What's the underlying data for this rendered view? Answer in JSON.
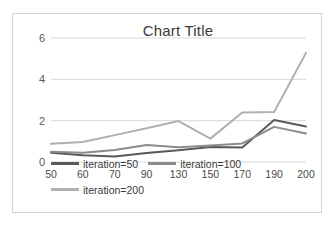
{
  "chart_data": {
    "type": "line",
    "title": "Chart Title",
    "xlabel": "",
    "ylabel": "",
    "categories": [
      "50",
      "60",
      "70",
      "90",
      "130",
      "150",
      "170",
      "190",
      "200"
    ],
    "ylim": [
      0,
      6
    ],
    "yticks": [
      0,
      2,
      4,
      6
    ],
    "grid": true,
    "legend_position": "bottom",
    "series": [
      {
        "name": "iteration=50",
        "color": "#595959",
        "values": [
          0.45,
          0.33,
          0.27,
          0.43,
          0.57,
          0.73,
          0.7,
          2.03,
          1.72
        ]
      },
      {
        "name": "iteration=100",
        "color": "#8c8c8c",
        "values": [
          0.5,
          0.45,
          0.58,
          0.82,
          0.71,
          0.8,
          0.9,
          1.7,
          1.38
        ]
      },
      {
        "name": "iteration=200",
        "color": "#b0b0b0",
        "values": [
          0.88,
          0.97,
          1.3,
          1.63,
          1.98,
          1.13,
          2.4,
          2.42,
          5.28
        ]
      }
    ]
  },
  "legend": {
    "row1": [
      {
        "label": "iteration=50",
        "color": "#595959"
      },
      {
        "label": "iteration=100",
        "color": "#8c8c8c"
      }
    ],
    "row2": [
      {
        "label": "iteration=200",
        "color": "#b0b0b0"
      }
    ]
  }
}
